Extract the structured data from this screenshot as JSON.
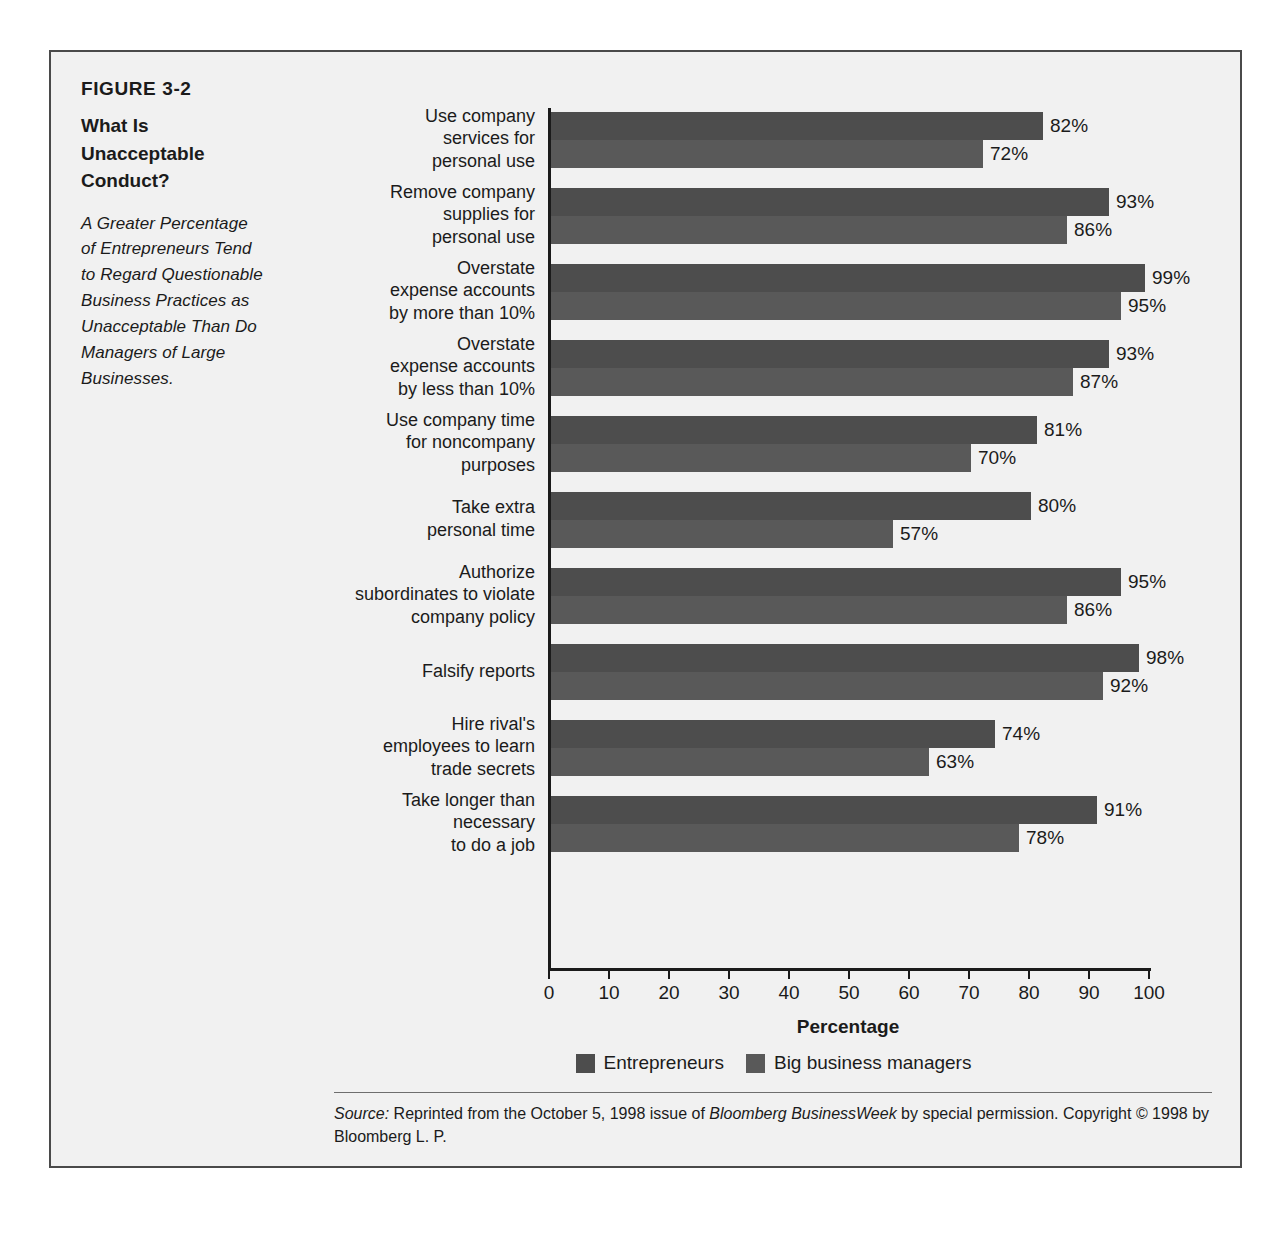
{
  "figure": {
    "number": "FIGURE 3-2",
    "title_lines": [
      "What Is",
      "Unacceptable",
      "Conduct?"
    ],
    "subtitle_lines": [
      "A Greater Percentage",
      "of Entrepreneurs Tend",
      "to Regard Questionable",
      "Business Practices as",
      "Unacceptable Than Do",
      "Managers of Large",
      "Businesses."
    ]
  },
  "source": {
    "label": "Source:",
    "text_before_italic": " Reprinted from the October 5, 1998 issue of ",
    "italic_publication": "Bloomberg BusinessWeek",
    "text_after_italic": " by special permission. Copyright © 1998 by Bloomberg L. P."
  },
  "colors": {
    "series_0": "#4d4d4d",
    "series_1": "#595959",
    "frame_border": "#4a4a4a",
    "panel_background": "#f1f1f1",
    "text": "#1b1b1b"
  },
  "chart_data": {
    "type": "bar",
    "orientation": "horizontal",
    "xlabel": "Percentage",
    "ylabel": "",
    "xlim": [
      0,
      100
    ],
    "xticks": [
      0,
      10,
      20,
      30,
      40,
      50,
      60,
      70,
      80,
      90,
      100
    ],
    "xtick_labels": [
      "0",
      "10",
      "20",
      "30",
      "40",
      "50",
      "60",
      "70",
      "80",
      "90",
      "100"
    ],
    "grid": false,
    "legend_position": "bottom-center",
    "value_suffix": "%",
    "categories": [
      "Use company services for personal use",
      "Remove company supplies for personal use",
      "Overstate expense accounts by more than 10%",
      "Overstate expense accounts by less than 10%",
      "Use company time for noncompany purposes",
      "Take extra personal time",
      "Authorize subordinates to violate company policy",
      "Falsify reports",
      "Hire rival's employees to learn trade secrets",
      "Take longer than necessary to do a job"
    ],
    "category_label_lines": [
      [
        "Use company",
        "services for",
        "personal use"
      ],
      [
        "Remove company",
        "supplies for",
        "personal use"
      ],
      [
        "Overstate",
        "expense accounts",
        "by more than 10%"
      ],
      [
        "Overstate",
        "expense accounts",
        "by less than 10%"
      ],
      [
        "Use company time",
        "for noncompany",
        "purposes"
      ],
      [
        "Take extra",
        "personal time"
      ],
      [
        "Authorize",
        "subordinates to violate",
        "company policy"
      ],
      [
        "Falsify reports"
      ],
      [
        "Hire rival's",
        "employees to learn",
        "trade secrets"
      ],
      [
        "Take longer than",
        "necessary",
        "to do a job"
      ]
    ],
    "series": [
      {
        "name": "Entrepreneurs",
        "values": [
          82,
          93,
          99,
          93,
          81,
          80,
          95,
          98,
          74,
          91
        ],
        "labels": [
          "82%",
          "93%",
          "99%",
          "93%",
          "81%",
          "80%",
          "95%",
          "98%",
          "74%",
          "91%"
        ],
        "color": "#4d4d4d"
      },
      {
        "name": "Big business managers",
        "values": [
          72,
          86,
          95,
          87,
          70,
          57,
          86,
          92,
          63,
          78
        ],
        "labels": [
          "72%",
          "86%",
          "95%",
          "87%",
          "70%",
          "57%",
          "86%",
          "92%",
          "63%",
          "78%"
        ],
        "color": "#595959"
      }
    ],
    "legend": [
      "Entrepreneurs",
      "Big business managers"
    ]
  }
}
